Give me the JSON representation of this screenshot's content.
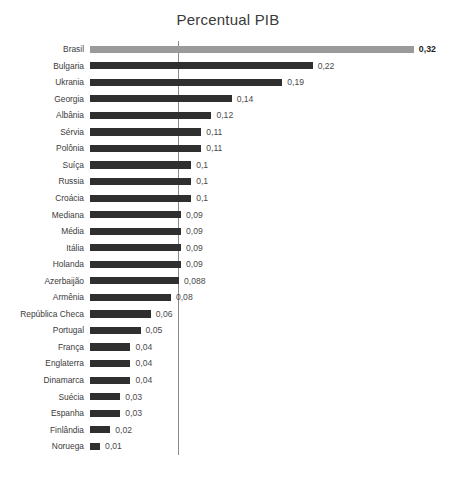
{
  "chart_data": {
    "type": "bar",
    "orientation": "horizontal",
    "title": "Percentual PIB",
    "xlabel": "",
    "ylabel": "",
    "grid": false,
    "legend": "none",
    "xlim": [
      0,
      0.32
    ],
    "reference_line": 0.088,
    "highlight_category": "Brasil",
    "highlight_color": "#9a9a9a",
    "bar_color": "#2f2f2f",
    "categories": [
      "Brasil",
      "Bulgaria",
      "Ukrania",
      "Georgia",
      "Albânia",
      "Sérvia",
      "Polônia",
      "Suíça",
      "Russia",
      "Croácia",
      "Mediana",
      "Média",
      "Itália",
      "Holanda",
      "Azerbaijão",
      "Armênia",
      "República Checa",
      "Portugal",
      "França",
      "Englaterra",
      "Dinamarca",
      "Suécia",
      "Espanha",
      "Finlândia",
      "Noruega"
    ],
    "values": [
      0.32,
      0.22,
      0.19,
      0.14,
      0.12,
      0.11,
      0.11,
      0.1,
      0.1,
      0.1,
      0.09,
      0.09,
      0.09,
      0.09,
      0.088,
      0.08,
      0.06,
      0.05,
      0.04,
      0.04,
      0.04,
      0.03,
      0.03,
      0.02,
      0.01
    ],
    "value_labels": [
      "0,32",
      "0,22",
      "0,19",
      "0,14",
      "0,12",
      "0,11",
      "0,11",
      "0,1",
      "0,1",
      "0,1",
      "0,09",
      "0,09",
      "0,09",
      "0,09",
      "0,088",
      "0,08",
      "0,06",
      "0,05",
      "0,04",
      "0,04",
      "0,04",
      "0,03",
      "0,03",
      "0,02",
      "0,01"
    ]
  }
}
